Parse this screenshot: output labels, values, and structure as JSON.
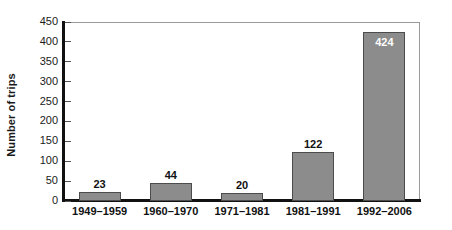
{
  "chart_data": {
    "type": "bar",
    "title": "",
    "xlabel": "",
    "ylabel": "Number of trips",
    "categories": [
      "1949–1959",
      "1960–1970",
      "1971–1981",
      "1981–1991",
      "1992–2006"
    ],
    "values": [
      23,
      44,
      20,
      122,
      424
    ],
    "value_labels": [
      "23",
      "44",
      "20",
      "122",
      "424"
    ],
    "ylim": [
      0,
      450
    ],
    "ytick_step": 50,
    "ytick_labels": [
      "0",
      "50",
      "100",
      "150",
      "200",
      "250",
      "300",
      "350",
      "400",
      "450"
    ],
    "grid": false,
    "legend": false,
    "legend_position": "none",
    "colors": {
      "bar_fill": "#8c8c8c",
      "bar_stroke": "#4c4c4c",
      "axis": "#111111",
      "frame": "#9a9a9a",
      "text": "#111111",
      "inside_label_text": "#ffffff",
      "background": "#ffffff"
    }
  }
}
